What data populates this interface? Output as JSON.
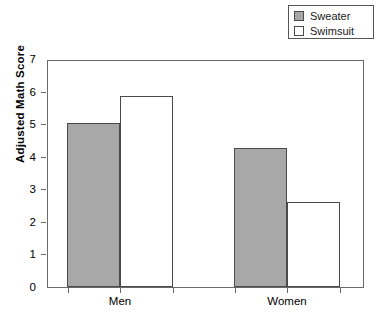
{
  "chart_data": {
    "type": "bar",
    "title": "",
    "subtitle": "",
    "xlabel": "",
    "ylabel": "Adjusted Math Score",
    "categories": [
      "Men",
      "Women"
    ],
    "series": [
      {
        "name": "Sweater",
        "values": [
          5.05,
          4.28
        ],
        "color": "#a8a8a8"
      },
      {
        "name": "Swimsuit",
        "values": [
          5.87,
          2.6
        ],
        "color": "#ffffff"
      }
    ],
    "ylim": [
      0,
      7
    ],
    "yticks": [
      0,
      1,
      2,
      3,
      4,
      5,
      6,
      7
    ],
    "ytick_labels": [
      "0",
      "1",
      "2",
      "3",
      "4",
      "5",
      "6",
      "7"
    ],
    "grid": false,
    "legend_position": "top-right",
    "annotations": []
  },
  "legend": {
    "items": [
      {
        "label": "Sweater",
        "swatch_color": "#a8a8a8"
      },
      {
        "label": "Swimsuit",
        "swatch_color": "#ffffff"
      }
    ]
  },
  "axes": {
    "y_title": "Adjusted Math Score",
    "y_labels": [
      "7",
      "6",
      "5",
      "4",
      "3",
      "2",
      "1",
      "0"
    ],
    "x_labels": [
      "Men",
      "Women"
    ]
  },
  "colors": {
    "sweater_fill": "#a8a8a8",
    "swimsuit_fill": "#ffffff",
    "bar_stroke": "#4a4a4a",
    "frame_stroke": "#6a6a6a",
    "background": "#ffffff"
  }
}
